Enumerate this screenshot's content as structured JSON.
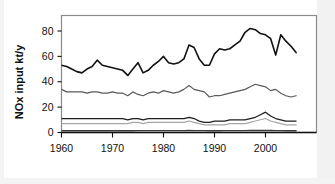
{
  "chart_data": {
    "type": "line",
    "title": "",
    "xlabel": "",
    "ylabel": "NOx input kt/y",
    "xlim": [
      1960,
      2006
    ],
    "ylim": [
      0,
      88
    ],
    "grid": false,
    "legend": "none",
    "x_ticks": [
      "1960",
      "1970",
      "1980",
      "1990",
      "2000"
    ],
    "x_tick_values": [
      1960,
      1970,
      1980,
      1990,
      2000
    ],
    "y_ticks": [
      "0",
      "20",
      "40",
      "60",
      "80"
    ],
    "y_tick_values": [
      0,
      20,
      40,
      60,
      80
    ],
    "x": [
      1960,
      1961,
      1962,
      1963,
      1964,
      1965,
      1966,
      1967,
      1968,
      1969,
      1970,
      1971,
      1972,
      1973,
      1974,
      1975,
      1976,
      1977,
      1978,
      1979,
      1980,
      1981,
      1982,
      1983,
      1984,
      1985,
      1986,
      1987,
      1988,
      1989,
      1990,
      1991,
      1992,
      1993,
      1994,
      1995,
      1996,
      1997,
      1998,
      1999,
      2000,
      2001,
      2002,
      2003,
      2004,
      2005,
      2006
    ],
    "series": [
      {
        "name": "total",
        "color": "#111111",
        "width": 1.6,
        "values": [
          53,
          52,
          50,
          48,
          47,
          50,
          52,
          57,
          53,
          52,
          51,
          50,
          49,
          45,
          50,
          55,
          47,
          49,
          53,
          56,
          60,
          55,
          54,
          55,
          58,
          69,
          67,
          58,
          53,
          53,
          62,
          66,
          65,
          66,
          69,
          72,
          79,
          82,
          81,
          78,
          77,
          74,
          61,
          77,
          72,
          68,
          63
        ]
      },
      {
        "name": "series-2",
        "color": "#5a5a5a",
        "width": 1.2,
        "values": [
          34,
          32,
          32,
          32,
          32,
          31,
          32,
          32,
          31,
          31,
          32,
          31,
          31,
          29,
          32,
          30,
          29,
          31,
          32,
          31,
          33,
          32,
          31,
          32,
          34,
          37,
          34,
          33,
          32,
          28,
          29,
          29,
          30,
          31,
          32,
          33,
          34,
          36,
          38,
          37,
          36,
          33,
          34,
          31,
          29,
          28,
          29
        ]
      },
      {
        "name": "series-3",
        "color": "#1e1e1e",
        "width": 1.3,
        "values": [
          11,
          11,
          11,
          11,
          11,
          11,
          11,
          11,
          11,
          11,
          11,
          11,
          11,
          10,
          11,
          11,
          10,
          11,
          11,
          11,
          11,
          11,
          11,
          11,
          11,
          12,
          11,
          9,
          8,
          8,
          9,
          9,
          9,
          10,
          10,
          10,
          10,
          11,
          12,
          14,
          16,
          13,
          11,
          10,
          9,
          9,
          9
        ]
      },
      {
        "name": "series-4",
        "color": "#a6a6a6",
        "width": 1.1,
        "values": [
          7,
          7,
          7,
          7,
          7,
          7,
          7,
          7,
          7,
          7,
          7,
          7,
          7,
          7,
          8,
          8,
          7,
          8,
          8,
          8,
          8,
          8,
          8,
          8,
          8,
          9,
          8,
          7,
          6,
          6,
          6,
          6,
          6,
          7,
          7,
          7,
          7,
          8,
          9,
          10,
          11,
          9,
          8,
          7,
          6,
          6,
          6
        ]
      },
      {
        "name": "series-5",
        "color": "#3a3a3a",
        "width": 1.4,
        "values": [
          1.4,
          1.4,
          1.4,
          1.4,
          1.4,
          1.4,
          1.4,
          1.4,
          1.4,
          1.4,
          1.4,
          1.4,
          1.4,
          1.4,
          1.4,
          1.5,
          1.5,
          1.5,
          1.5,
          1.5,
          1.5,
          1.5,
          1.5,
          1.5,
          1.5,
          1.6,
          1.5,
          1.5,
          1.5,
          1.4,
          1.4,
          1.4,
          1.5,
          1.5,
          1.5,
          1.5,
          1.5,
          1.6,
          1.6,
          1.6,
          1.7,
          1.6,
          1.5,
          1.5,
          1.4,
          1.4,
          1.4
        ]
      }
    ]
  }
}
